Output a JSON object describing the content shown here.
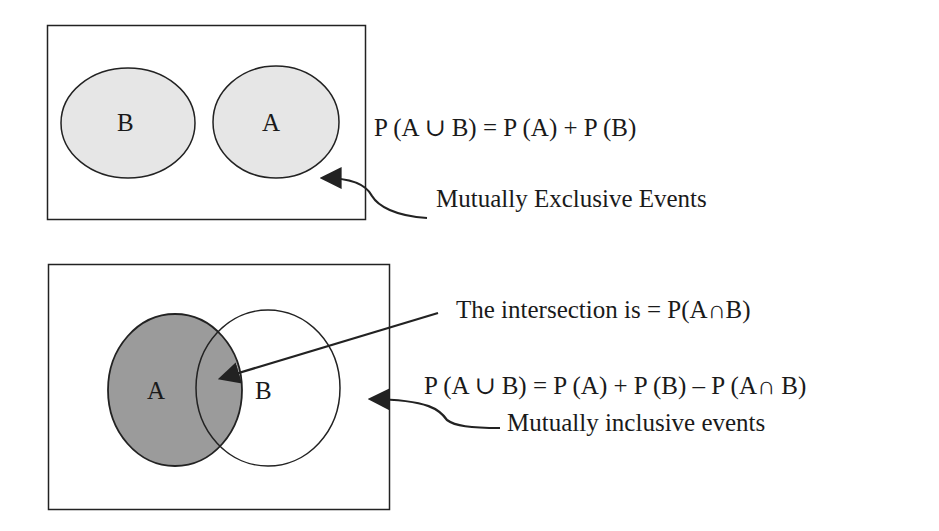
{
  "top_diagram": {
    "title": "Mutually Exclusive Events",
    "set_left_label": "B",
    "set_right_label": "A",
    "formula": "P (A ∪ B) = P (A) + P (B)",
    "caption": "Mutually Exclusive Events",
    "fill_color": "#e6e6e6"
  },
  "bottom_diagram": {
    "set_left_label": "A",
    "set_right_label": "B",
    "intersection_note": "The intersection is = P(A∩B)",
    "formula": "P (A ∪ B) = P (A) + P (B) – P (A∩ B)",
    "caption": "Mutually inclusive events",
    "fill_color_a": "#9b9b9b",
    "fill_color_b": "#ffffff"
  },
  "colors": {
    "stroke": "#222222",
    "background": "#ffffff"
  }
}
